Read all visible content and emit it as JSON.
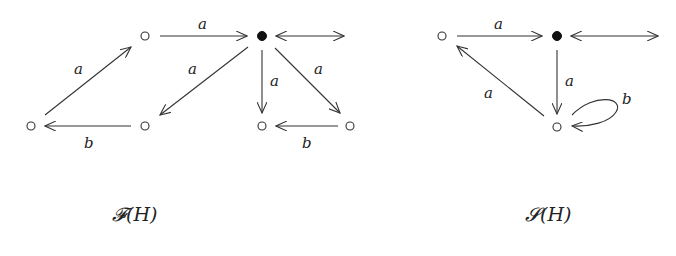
{
  "diagrams": [
    {
      "caption": "𝓕(H)",
      "nodes": [
        {
          "id": "f_top_left",
          "kind": "hollow"
        },
        {
          "id": "f_center",
          "kind": "filled"
        },
        {
          "id": "f_bottom_far_left",
          "kind": "hollow"
        },
        {
          "id": "f_bottom_left",
          "kind": "hollow"
        },
        {
          "id": "f_bottom_mid",
          "kind": "hollow"
        },
        {
          "id": "f_bottom_right",
          "kind": "hollow"
        }
      ],
      "edges": [
        {
          "from": "f_top_left",
          "to": "f_center",
          "label": "a"
        },
        {
          "from": "f_bottom_far_left",
          "to": "f_top_left",
          "label": "a"
        },
        {
          "from": "f_bottom_left",
          "to": "f_bottom_far_left",
          "label": "b"
        },
        {
          "from": "f_center",
          "to": "f_bottom_left",
          "label": "a"
        },
        {
          "from": "f_center",
          "to": "f_bottom_mid",
          "label": "a"
        },
        {
          "from": "f_center",
          "to": "f_bottom_right",
          "label": "a"
        },
        {
          "from": "f_bottom_right",
          "to": "f_bottom_mid",
          "label": "b"
        },
        {
          "from": "f_center",
          "to": "outside",
          "label": "",
          "bidirectional": true
        }
      ]
    },
    {
      "caption": "𝓢(H)",
      "nodes": [
        {
          "id": "s_left",
          "kind": "hollow"
        },
        {
          "id": "s_center",
          "kind": "filled"
        },
        {
          "id": "s_bottom",
          "kind": "hollow"
        }
      ],
      "edges": [
        {
          "from": "s_left",
          "to": "s_center",
          "label": "a"
        },
        {
          "from": "s_center",
          "to": "s_bottom",
          "label": "a"
        },
        {
          "from": "s_bottom",
          "to": "s_left",
          "label": "a"
        },
        {
          "from": "s_bottom",
          "to": "s_bottom",
          "label": "b",
          "loop": true
        },
        {
          "from": "s_center",
          "to": "outside",
          "label": "",
          "bidirectional": true
        }
      ]
    }
  ]
}
